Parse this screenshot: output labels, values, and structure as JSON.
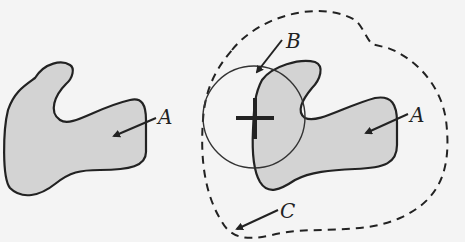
{
  "diagram": {
    "colors": {
      "background": "#f4f4f4",
      "shape_fill": "#d3d3d3",
      "stroke": "#222222"
    },
    "left_panel": {
      "shape_label": "A"
    },
    "right_panel": {
      "shape_label": "A",
      "circle_label": "B",
      "boundary_label": "C"
    }
  }
}
